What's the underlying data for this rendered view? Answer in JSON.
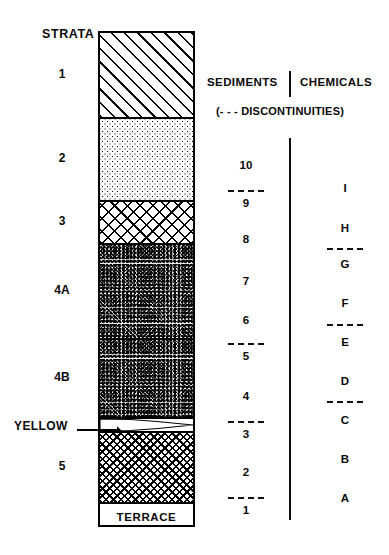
{
  "figure": {
    "strata_heading": "STRATA",
    "sediments_heading": "SEDIMENTS",
    "chemicals_heading": "CHEMICALS",
    "discontinuities_note": "(- - - DISCONTINUITIES)",
    "terrace_label": "TERRACE",
    "yellow_callout": "YELLOW"
  },
  "chart_data": {
    "type": "table",
    "title": "STRATA",
    "xlabel": "",
    "ylabel": "",
    "columns": [
      "STRATA",
      "SEDIMENTS",
      "CHEMICALS"
    ],
    "annotations": [
      "YELLOW",
      "TERRACE",
      "(- - - DISCONTINUITIES)"
    ],
    "strata": [
      {
        "label": "1",
        "pattern": "diagonal-hatch",
        "top": 0,
        "height": 84
      },
      {
        "label": "2",
        "pattern": "fine-dots",
        "top": 84,
        "height": 83
      },
      {
        "label": "3",
        "pattern": "open-crosshatch",
        "top": 167,
        "height": 43
      },
      {
        "label": "4A",
        "pattern": "coarse-stipple",
        "top": 210,
        "height": 95
      },
      {
        "label": "4B",
        "pattern": "coarse-stipple",
        "top": 305,
        "height": 79
      },
      {
        "label": "",
        "pattern": "yellow-lens",
        "top": 384,
        "height": 14
      },
      {
        "label": "5",
        "pattern": "dense-crosshatch",
        "top": 398,
        "height": 71
      },
      {
        "label": "",
        "pattern": "terrace-box",
        "top": 469,
        "height": 27
      }
    ],
    "sediments": [
      {
        "label": "10",
        "y": 165
      },
      {
        "label": "9",
        "y": 203
      },
      {
        "label": "8",
        "y": 239
      },
      {
        "label": "7",
        "y": 281
      },
      {
        "label": "6",
        "y": 320
      },
      {
        "label": "5",
        "y": 356
      },
      {
        "label": "4",
        "y": 396
      },
      {
        "label": "3",
        "y": 434
      },
      {
        "label": "2",
        "y": 472
      },
      {
        "label": "1",
        "y": 510
      }
    ],
    "sediment_discontinuities": [
      {
        "between": [
          "10",
          "9"
        ],
        "y": 190
      },
      {
        "between": [
          "6",
          "5"
        ],
        "y": 343
      },
      {
        "between": [
          "4",
          "3"
        ],
        "y": 421
      },
      {
        "between": [
          "2",
          "1"
        ],
        "y": 497
      }
    ],
    "chemicals": [
      {
        "label": "I",
        "y": 188
      },
      {
        "label": "H",
        "y": 228
      },
      {
        "label": "G",
        "y": 264
      },
      {
        "label": "F",
        "y": 303
      },
      {
        "label": "E",
        "y": 342
      },
      {
        "label": "D",
        "y": 381
      },
      {
        "label": "C",
        "y": 420
      },
      {
        "label": "B",
        "y": 459
      },
      {
        "label": "A",
        "y": 498
      }
    ],
    "chemical_discontinuities": [
      {
        "between": [
          "H",
          "G"
        ],
        "y": 248
      },
      {
        "between": [
          "F",
          "E"
        ],
        "y": 324
      },
      {
        "between": [
          "D",
          "C"
        ],
        "y": 401
      }
    ],
    "colors": {
      "ink": "#000000",
      "background": "#ffffff"
    }
  }
}
